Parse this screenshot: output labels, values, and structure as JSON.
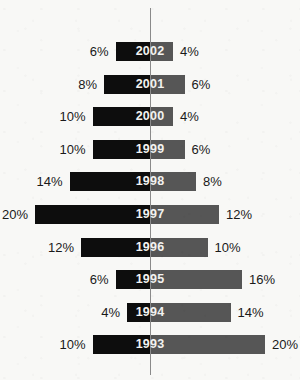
{
  "chart_data": {
    "type": "bar",
    "subtype": "diverging-population-pyramid",
    "title": "",
    "subtitle": "",
    "xlabel": "",
    "ylabel": "",
    "categories": [
      "2002",
      "2001",
      "2000",
      "1999",
      "1998",
      "1997",
      "1996",
      "1995",
      "1994",
      "1993"
    ],
    "series": [
      {
        "name": "left",
        "side": "left",
        "color": "#0d0d0d",
        "values": [
          6,
          8,
          10,
          10,
          14,
          20,
          12,
          6,
          4,
          10
        ],
        "labels": [
          "6%",
          "8%",
          "10%",
          "10%",
          "14%",
          "20%",
          "12%",
          "6%",
          "4%",
          "10%"
        ]
      },
      {
        "name": "right",
        "side": "right",
        "color": "#565656",
        "values": [
          4,
          6,
          4,
          6,
          8,
          12,
          10,
          16,
          14,
          20
        ],
        "labels": [
          "4%",
          "6%",
          "4%",
          "6%",
          "8%",
          "12%",
          "10%",
          "16%",
          "14%",
          "20%"
        ]
      }
    ],
    "units": "%",
    "xlim": [
      20,
      20
    ],
    "axis": {
      "center_line": true,
      "center_line_color": "#8a8a8a",
      "grid": false,
      "ticks": []
    },
    "legend": {
      "visible": false,
      "position": "none"
    },
    "px_per_percent": 5.75,
    "background_color": "#f8f8f6",
    "year_label_color": "#f2f2f0",
    "pct_label_color": "#1a1a1a"
  },
  "rows": [
    {
      "year": "2002",
      "left_value": 6,
      "right_value": 4,
      "left_label": "6%",
      "right_label": "4%"
    },
    {
      "year": "2001",
      "left_value": 8,
      "right_value": 6,
      "left_label": "8%",
      "right_label": "6%"
    },
    {
      "year": "2000",
      "left_value": 10,
      "right_value": 4,
      "left_label": "10%",
      "right_label": "4%"
    },
    {
      "year": "1999",
      "left_value": 10,
      "right_value": 6,
      "left_label": "10%",
      "right_label": "6%"
    },
    {
      "year": "1998",
      "left_value": 14,
      "right_value": 8,
      "left_label": "14%",
      "right_label": "8%"
    },
    {
      "year": "1997",
      "left_value": 20,
      "right_value": 12,
      "left_label": "20%",
      "right_label": "12%"
    },
    {
      "year": "1996",
      "left_value": 12,
      "right_value": 10,
      "left_label": "12%",
      "right_label": "10%"
    },
    {
      "year": "1995",
      "left_value": 6,
      "right_value": 16,
      "left_label": "6%",
      "right_label": "16%"
    },
    {
      "year": "1994",
      "left_value": 4,
      "right_value": 14,
      "left_label": "4%",
      "right_label": "14%"
    },
    {
      "year": "1993",
      "left_value": 10,
      "right_value": 20,
      "left_label": "10%",
      "right_label": "20%"
    }
  ],
  "layout": {
    "center_x": 150,
    "first_row_top": 42,
    "row_pitch": 32.6,
    "bar_height": 19,
    "label_gap": 7
  }
}
